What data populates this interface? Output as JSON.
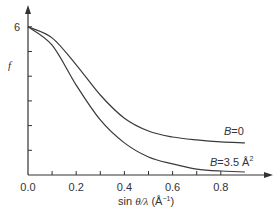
{
  "chart_data": {
    "type": "line",
    "title": "",
    "xlabel": "sin θ/λ (Å⁻¹)",
    "ylabel": "f",
    "xlim": [
      0.0,
      0.9
    ],
    "ylim": [
      0,
      6
    ],
    "grid": false,
    "legend_position": "inline labels near right end of curves",
    "x_ticks": [
      0.0,
      0.1,
      0.2,
      0.3,
      0.4,
      0.5,
      0.6,
      0.7,
      0.8
    ],
    "x_tick_labels": [
      "0.0",
      "0.2",
      "0.4",
      "0.6",
      "0.8"
    ],
    "y_ticks": [
      0,
      1,
      2,
      3,
      4,
      5,
      6
    ],
    "y_tick_labels": [
      "6"
    ],
    "x": [
      0.0,
      0.1,
      0.2,
      0.3,
      0.4,
      0.5,
      0.6,
      0.7,
      0.8,
      0.9
    ],
    "series": [
      {
        "name": "B=0",
        "label_main": "B",
        "label_rest": "=0",
        "values": [
          6.0,
          5.55,
          4.46,
          3.24,
          2.3,
          1.78,
          1.54,
          1.42,
          1.34,
          1.3
        ]
      },
      {
        "name": "B=3.5 Å²",
        "label_main": "B",
        "label_rest": "=3.5 Å",
        "label_sup": "2",
        "values": [
          6.0,
          5.26,
          3.64,
          2.23,
          1.3,
          0.73,
          0.45,
          0.24,
          0.16,
          0.12
        ]
      }
    ]
  },
  "labels": {
    "y_axis": "f",
    "y_max_tick": "6",
    "x_axis_prefix": "sin ",
    "x_axis_theta": "θ/λ",
    "x_axis_unit": " (Å",
    "x_axis_unit_sup": "−1",
    "x_axis_close": ")",
    "x_ticks": [
      "0.0",
      "0.2",
      "0.4",
      "0.6",
      "0.8"
    ],
    "b0_main": "B",
    "b0_rest": "=0",
    "b35_main": "B",
    "b35_rest": "=3.5 Å",
    "b35_sup": "2"
  },
  "colors": {
    "axis": "#333333",
    "curve": "#3a3a3a",
    "background": "#ffffff"
  }
}
